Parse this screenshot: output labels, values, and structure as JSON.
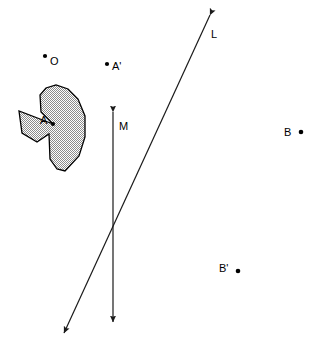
{
  "figure": {
    "background_color": "#ffffff",
    "ink_color": "#000000",
    "shape_fill_color": "#b3b3b3",
    "labels": {
      "shape_A": "A",
      "center_O": "O",
      "image_A_prime": "A'",
      "line_L": "L",
      "line_M": "M",
      "point_B": "B",
      "point_B_prime": "B'"
    },
    "points": [
      {
        "name": "O",
        "label": "O",
        "dot_x": 45,
        "dot_y": 56,
        "label_x": 50,
        "label_y": 65
      },
      {
        "name": "A",
        "label": "A",
        "dot_x": 53,
        "dot_y": 124,
        "label_x": 40,
        "label_y": 124
      },
      {
        "name": "A'",
        "label": "A'",
        "dot_x": 107,
        "dot_y": 64,
        "label_x": 112,
        "label_y": 70
      },
      {
        "name": "B",
        "label": "B",
        "dot_x": 301,
        "dot_y": 132,
        "label_x": 284,
        "label_y": 136
      },
      {
        "name": "B'",
        "label": "B'",
        "dot_x": 238,
        "dot_y": 271,
        "label_x": 219,
        "label_y": 272
      }
    ],
    "lines": [
      {
        "name": "L",
        "label": "L",
        "label_x": 211,
        "label_y": 38,
        "x1": 210,
        "y1": 15,
        "x2": 64,
        "y2": 333,
        "arrow_start": true,
        "arrow_end": true
      },
      {
        "name": "M",
        "label": "M",
        "label_x": 119,
        "label_y": 130,
        "x1": 113,
        "y1": 112,
        "x2": 113,
        "y2": 322,
        "arrow_start": true,
        "arrow_end": true
      }
    ],
    "intersection": {
      "x": 113,
      "y": 230
    },
    "shape_path": "M 53 124 L 19 111 L 22 133 L 37 142 L 49 134 L 50 159 L 57 169 L 65 171 L 79 156 L 85 137 L 85 116 L 78 99 L 68 89 L 56 85 L 46 88 L 40 95 L 41 112 Z"
  }
}
